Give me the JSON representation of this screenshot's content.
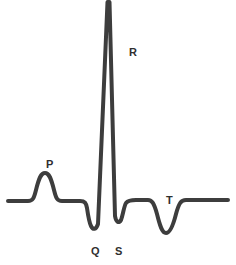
{
  "figure": {
    "width": 236,
    "height": 265,
    "background_color": "#ffffff",
    "trace_color": "#3d3d3d",
    "trace_width": 4,
    "label_color": "#2f2f2f"
  },
  "labels": {
    "p": "P",
    "q": "Q",
    "r": "R",
    "s": "S",
    "t": "T"
  },
  "chart_data": {
    "type": "line",
    "xlabel": "",
    "ylabel": "",
    "grid": false,
    "legend": "none",
    "axis_visible": false,
    "baseline_y": 201,
    "xlim": [
      0,
      236
    ],
    "ylim": [
      265,
      0
    ],
    "annotations": [
      {
        "label": "P",
        "x": 46,
        "y": 159,
        "wave": "P wave",
        "polarity": "positive",
        "peak_x": 45,
        "peak_y": 173
      },
      {
        "label": "Q",
        "x": 91,
        "y": 246,
        "wave": "Q wave",
        "polarity": "negative",
        "peak_x": 95,
        "peak_y": 228
      },
      {
        "label": "R",
        "x": 129,
        "y": 47,
        "wave": "R wave",
        "polarity": "positive",
        "peak_x": 108,
        "peak_y": 0
      },
      {
        "label": "S",
        "x": 115,
        "y": 246,
        "wave": "S wave",
        "polarity": "negative",
        "peak_x": 118,
        "peak_y": 223
      },
      {
        "label": "T",
        "x": 166,
        "y": 195,
        "wave": "T wave",
        "polarity": "negative",
        "peak_x": 163,
        "peak_y": 233
      }
    ],
    "series": [
      {
        "name": "ECG trace",
        "path": "M 8,201 L 28,201 C 33,201 34,198 36,190 C 39,178 41,173 45,173 C 49,173 51,178 54,190 C 56,198 57,201 62,201 L 80,201 C 85,201 86,203 87,208 C 88,215 89,222 91,226 C 93,230 96,230 98,224 L 107.5,2 L 109.5,2 L 115,216 C 116,222 119,224 121,220 C 123,215 124,206 126,203 C 128,200.5 131,200 136,200 L 148,200 C 152,200 154,203 157,214 C 160,226 162,233 166,233 C 170,233 173,226 176,214 C 179,203 181,200 186,200 L 228,200"
      }
    ]
  }
}
